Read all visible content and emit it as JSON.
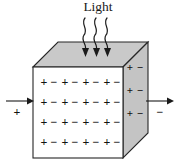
{
  "figure": {
    "title": "Light",
    "colors": {
      "top_face": "#c9c9c9",
      "right_face": "#c4c4c4",
      "front_face": "#ffffff",
      "edge": "#262626",
      "ink": "#1a1a1a"
    }
  },
  "light_label": "Light",
  "rays": [
    {
      "name": "ray-1"
    },
    {
      "name": "ray-2"
    },
    {
      "name": "ray-3"
    }
  ],
  "front_face": {
    "rows": [
      {
        "pairs": [
          {
            "plus": "+",
            "minus": "−"
          },
          {
            "plus": "+",
            "minus": "−"
          },
          {
            "plus": "+",
            "minus": "−"
          },
          {
            "plus": "+",
            "minus": "−"
          }
        ]
      },
      {
        "pairs": [
          {
            "plus": "+",
            "minus": "−"
          },
          {
            "plus": "+",
            "minus": "−"
          },
          {
            "plus": "+",
            "minus": "−"
          },
          {
            "plus": "+",
            "minus": "−"
          }
        ]
      },
      {
        "pairs": [
          {
            "plus": "+",
            "minus": "−"
          },
          {
            "plus": "+",
            "minus": "−"
          },
          {
            "plus": "+",
            "minus": "−"
          },
          {
            "plus": "+",
            "minus": "−"
          }
        ]
      },
      {
        "pairs": [
          {
            "plus": "+",
            "minus": "−"
          },
          {
            "plus": "+",
            "minus": "−"
          },
          {
            "plus": "+",
            "minus": "−"
          },
          {
            "plus": "+",
            "minus": "−"
          }
        ]
      }
    ]
  },
  "right_face": {
    "rows": [
      {
        "plus": "+",
        "minus": "−"
      },
      {
        "plus": "+",
        "minus": "−"
      },
      {
        "plus": "+",
        "minus": "−"
      }
    ]
  },
  "terminals": {
    "left": {
      "label": "+",
      "name": "positive-terminal"
    },
    "right": {
      "label": "−",
      "name": "negative-terminal"
    }
  }
}
